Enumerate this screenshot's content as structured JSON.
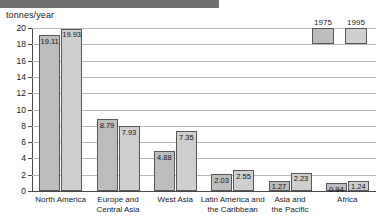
{
  "header": {
    "bar_color": "#6f6f6f"
  },
  "chart_data": {
    "type": "bar",
    "title": "",
    "subtitle": "",
    "xlabel": "",
    "ylabel": "tonnes/year",
    "ylim": [
      0,
      20
    ],
    "ytick_step": 2,
    "yticks": [
      0,
      2,
      4,
      6,
      8,
      10,
      12,
      14,
      16,
      18,
      20
    ],
    "ytick_labels": [
      "0",
      "2",
      "4",
      "6",
      "8",
      "10",
      "12",
      "14",
      "16",
      "18",
      "20"
    ],
    "grid": true,
    "grid_orientation": "horizontal",
    "legend_position": "top-right",
    "categories": [
      "North America",
      "Europe and\nCentral Asia",
      "West Asia",
      "Latin America and\nthe Caribbean",
      "Asia and\nthe Pacific",
      "Africa"
    ],
    "series": [
      {
        "name": "1975",
        "color": "#bdbdbd",
        "values": [
          19.11,
          8.79,
          4.88,
          2.03,
          1.27,
          0.94
        ],
        "labels": [
          "19.11",
          "8.79",
          "4.88",
          "2.03",
          "1.27",
          "0.94"
        ]
      },
      {
        "name": "1995",
        "color": "#cfcfcf",
        "values": [
          19.93,
          7.93,
          7.35,
          2.55,
          2.23,
          1.24
        ],
        "labels": [
          "19.93",
          "7.93",
          "7.35",
          "2.55",
          "2.23",
          "1.24"
        ]
      }
    ]
  }
}
